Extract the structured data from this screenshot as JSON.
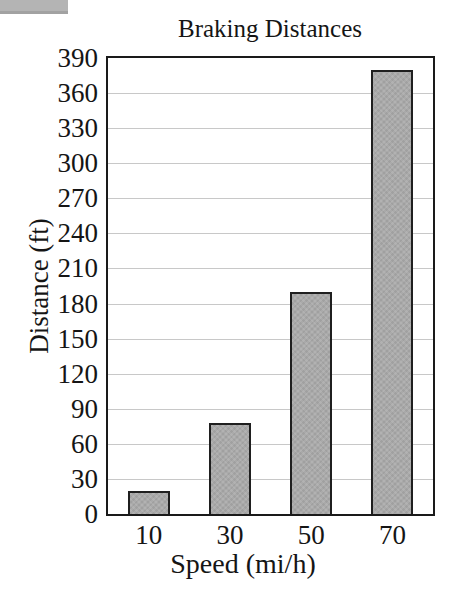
{
  "chart_data": {
    "type": "bar",
    "title": "Braking Distances",
    "xlabel": "Speed (mi/h)",
    "ylabel": "Distance (ft)",
    "categories": [
      "10",
      "30",
      "50",
      "70"
    ],
    "values": [
      20,
      78,
      190,
      380
    ],
    "ylim": [
      0,
      390
    ],
    "ytick_step": 30,
    "grid": "horizontal",
    "legend": "none"
  },
  "colors": {
    "background": "#ffffff",
    "text": "#151515",
    "frame": "#1a1a1a",
    "gridline": "#c8c8c8",
    "bar_fill": "#a9a9a9",
    "bar_border": "#1f1f1f",
    "scan_artifact": "#b4b4b4"
  }
}
